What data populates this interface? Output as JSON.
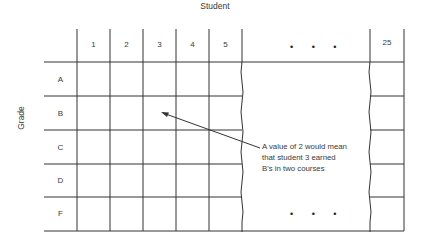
{
  "title": "Student",
  "y_axis_label": "Grade",
  "columns": [
    "1",
    "2",
    "3",
    "4",
    "5",
    "25"
  ],
  "ellipsis": "• • •",
  "rows": [
    "A",
    "B",
    "C",
    "D",
    "F"
  ],
  "annotation": {
    "line1": "A value of 2 would mean",
    "line2": "that student 3 earned",
    "line3": "B's in two courses"
  }
}
